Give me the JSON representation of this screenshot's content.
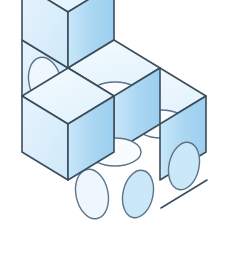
{
  "figure": {
    "cube_count": 5,
    "background": "#ffffff"
  },
  "colors": {
    "top_face": "#eef8fd",
    "left_face": "#ddeffb",
    "right_face": "#a9d6f2",
    "right_face_light": "#bfe2f7",
    "top_face_shade": "#e3f3fc",
    "stroke": "#3c4d5c",
    "ellipse_stroke": "#5d7488",
    "ellipse_fill_top": "#f7fcff",
    "ellipse_fill_left": "#eaf6fd",
    "ellipse_fill_right": "#cbe8f9"
  },
  "geometry": {
    "origin_x": 68,
    "origin_y": 12,
    "half_width": 46,
    "half_depth": 28,
    "cube_height": 56,
    "stroke_width": 1.6
  },
  "cubes": [
    {
      "name": "cube-back-top",
      "col": 0,
      "row": 0,
      "level": 1,
      "faces": [
        "top",
        "left",
        "right"
      ]
    },
    {
      "name": "cube-back-bottom",
      "col": 0,
      "row": 0,
      "level": 0,
      "faces": [
        "left",
        "right"
      ]
    },
    {
      "name": "cube-middle",
      "col": 1,
      "row": 0,
      "level": 0,
      "faces": [
        "top",
        "left",
        "right"
      ]
    },
    {
      "name": "cube-right-back",
      "col": 2,
      "row": 0,
      "level": 0,
      "faces": [
        "top",
        "right"
      ]
    },
    {
      "name": "cube-front",
      "col": 1,
      "row": 1,
      "level": 0,
      "faces": [
        "top",
        "left",
        "right"
      ]
    }
  ],
  "labels": {
    "caption": ""
  }
}
